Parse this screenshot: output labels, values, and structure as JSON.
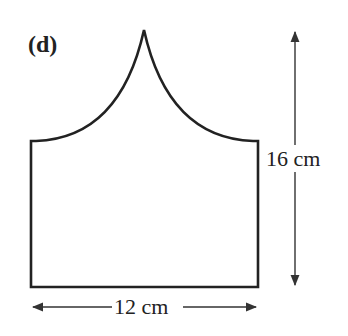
{
  "figure": {
    "label": "(d)",
    "height_label": "16 cm",
    "width_label": "12 cm",
    "stroke_color": "#222222",
    "arrow_color": "#333333",
    "background": "#ffffff"
  },
  "shape": {
    "description": "Rectangle with two concave quarter-circle arcs meeting at a cusp on top",
    "width_cm": 12,
    "total_height_cm": 16
  }
}
